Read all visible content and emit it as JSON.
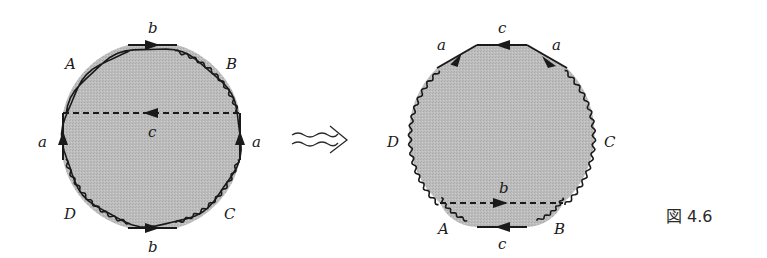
{
  "figure": {
    "caption": "図 4.6",
    "fill_color": "#bdbdbd",
    "stroke_color": "#1a1a1a"
  },
  "left_diagram": {
    "edge_labels": {
      "top": "b",
      "bottom": "b",
      "left": "a",
      "right": "a",
      "cut": "c"
    },
    "vertex_labels": {
      "top_left": "A",
      "top_right": "B",
      "bottom_left": "D",
      "bottom_right": "C"
    }
  },
  "transform_arrow": {
    "symbol": "wavy-double-arrow"
  },
  "right_diagram": {
    "edge_labels": {
      "top": "c",
      "bottom": "c",
      "upper_left": "a",
      "upper_right": "a",
      "cut": "b"
    },
    "vertex_labels": {
      "left": "D",
      "right": "C",
      "bottom_left": "A",
      "bottom_right": "B"
    }
  }
}
